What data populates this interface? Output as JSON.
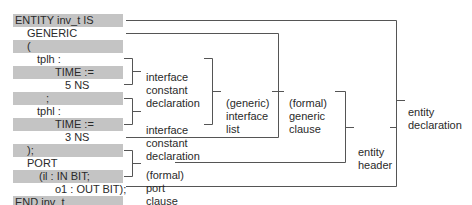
{
  "code_lines": [
    {
      "text": "ENTITY inv_t IS",
      "indent": 2,
      "shaded": true
    },
    {
      "text": "GENERIC",
      "indent": 14,
      "shaded": false
    },
    {
      "text": "(",
      "indent": 14,
      "shaded": true
    },
    {
      "text": "tplh :",
      "indent": 24,
      "shaded": false
    },
    {
      "text": "TIME :=",
      "indent": 42,
      "shaded": true
    },
    {
      "text": "5 NS",
      "indent": 52,
      "shaded": false
    },
    {
      "text": ";",
      "indent": 33,
      "shaded": true
    },
    {
      "text": "tphl :",
      "indent": 24,
      "shaded": false
    },
    {
      "text": "TIME :=",
      "indent": 42,
      "shaded": true
    },
    {
      "text": "3 NS",
      "indent": 52,
      "shaded": false
    },
    {
      "text": ");",
      "indent": 14,
      "shaded": true
    },
    {
      "text": "PORT",
      "indent": 14,
      "shaded": false
    },
    {
      "text": "(il : IN BIT;",
      "indent": 26,
      "shaded": true
    },
    {
      "text": "o1 : OUT BIT);",
      "indent": 42,
      "shaded": false
    },
    {
      "text": "END inv_t",
      "indent": 2,
      "shaded": true
    }
  ],
  "labels": {
    "icd1": [
      "interface",
      "constant",
      "declaration"
    ],
    "icd2": [
      "interface",
      "constant",
      "declaration"
    ],
    "interface_list": [
      "(generic)",
      "interface",
      "list"
    ],
    "generic_clause": [
      "(formal)",
      "generic",
      "clause"
    ],
    "port_clause": [
      "(formal)",
      "port",
      "clause"
    ],
    "entity_header": [
      "entity",
      "header"
    ],
    "entity_declaration": [
      "entity",
      "declaration"
    ]
  },
  "colors": {
    "shade": "#c4c4c4",
    "line": "#555555",
    "text": "#2a2a2a"
  }
}
